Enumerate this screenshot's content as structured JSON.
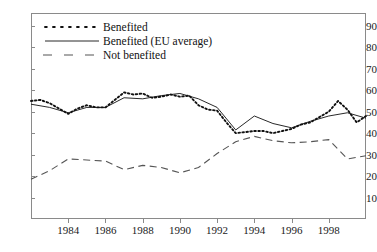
{
  "chart_data": {
    "type": "line",
    "title": "",
    "subtitle": "",
    "xlabel": "",
    "ylabel": "",
    "xlim": [
      1982,
      2000
    ],
    "ylim": [
      0,
      96
    ],
    "grid": false,
    "legend_position": "top-left",
    "y_ticks": [
      10,
      20,
      30,
      40,
      50,
      60,
      70,
      80,
      90
    ],
    "x_ticks": [
      1984,
      1986,
      1988,
      1990,
      1992,
      1994,
      1996,
      1998
    ],
    "x": [
      1982,
      1983,
      1984,
      1985,
      1986,
      1987,
      1988,
      1989,
      1990,
      1991,
      1992,
      1993,
      1994,
      1995,
      1996,
      1997,
      1998,
      1999,
      2000
    ],
    "series": [
      {
        "name": "Benefited",
        "style": "dotted",
        "color": "#111111",
        "x": [
          1982.0,
          1982.5,
          1983.0,
          1983.5,
          1984.0,
          1984.5,
          1985.0,
          1985.5,
          1986.0,
          1986.5,
          1987.0,
          1987.5,
          1988.0,
          1988.5,
          1989.0,
          1989.5,
          1990.0,
          1990.5,
          1991.0,
          1991.5,
          1992.0,
          1992.5,
          1993.0,
          1993.5,
          1994.0,
          1994.5,
          1995.0,
          1995.5,
          1996.0,
          1996.5,
          1997.0,
          1997.5,
          1998.0,
          1998.5,
          1999.0,
          1999.5,
          2000.0
        ],
        "values": [
          55.0,
          55.5,
          54.0,
          51.5,
          49.0,
          51.5,
          53.0,
          52.0,
          52.0,
          55.5,
          59.0,
          58.0,
          58.5,
          56.5,
          57.0,
          58.0,
          57.0,
          57.5,
          53.0,
          51.0,
          50.5,
          45.0,
          40.0,
          40.5,
          41.0,
          41.0,
          40.0,
          41.0,
          42.0,
          44.0,
          45.0,
          47.5,
          50.0,
          55.0,
          51.0,
          45.0,
          48.0
        ]
      },
      {
        "name": "Benefited (EU average)",
        "style": "solid",
        "color": "#111111",
        "x": [
          1982.0,
          1983.0,
          1984.0,
          1985.0,
          1986.0,
          1987.0,
          1988.0,
          1989.0,
          1990.0,
          1991.0,
          1992.0,
          1993.0,
          1994.0,
          1995.0,
          1996.0,
          1997.0,
          1998.0,
          1999.0,
          2000.0
        ],
        "values": [
          53.5,
          52.0,
          49.5,
          52.0,
          52.0,
          56.5,
          56.0,
          57.5,
          58.5,
          56.0,
          52.0,
          41.5,
          48.0,
          44.5,
          42.5,
          45.5,
          48.0,
          49.5,
          47.0
        ]
      },
      {
        "name": "Not benefited",
        "style": "dashed",
        "color": "#555555",
        "x": [
          1982.0,
          1983.0,
          1984.0,
          1985.0,
          1986.0,
          1987.0,
          1988.0,
          1989.0,
          1990.0,
          1991.0,
          1992.0,
          1993.0,
          1994.0,
          1995.0,
          1996.0,
          1997.0,
          1998.0,
          1999.0,
          2000.0
        ],
        "values": [
          18.5,
          22.5,
          28.0,
          27.5,
          27.0,
          23.0,
          25.0,
          24.0,
          21.5,
          24.0,
          30.5,
          36.0,
          38.5,
          36.5,
          35.5,
          36.0,
          37.0,
          28.0,
          29.5
        ]
      }
    ]
  },
  "legend": {
    "items": [
      {
        "label": "Benefited",
        "style": "dotted"
      },
      {
        "label": "Benefited (EU average)",
        "style": "solid"
      },
      {
        "label": "Not benefited",
        "style": "dashed"
      }
    ]
  }
}
